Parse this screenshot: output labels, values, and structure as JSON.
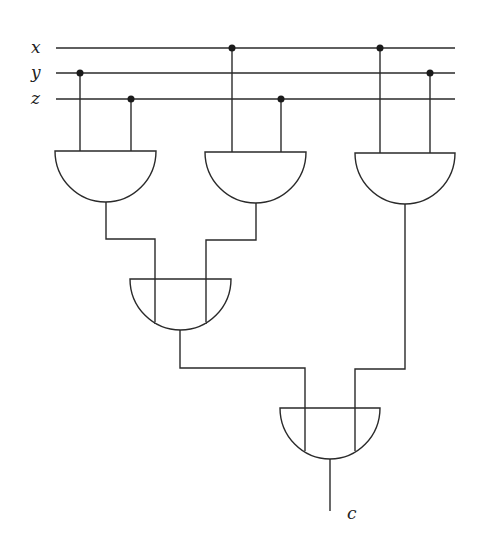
{
  "diagram": {
    "type": "logic-circuit",
    "inputs": [
      {
        "label": "x",
        "line_y": 48
      },
      {
        "label": "y",
        "line_y": 73
      },
      {
        "label": "z",
        "line_y": 99
      }
    ],
    "output": {
      "label": "c"
    },
    "gates": [
      {
        "id": "gate-1",
        "type": "AND",
        "inputs": [
          "y",
          "z"
        ]
      },
      {
        "id": "gate-2",
        "type": "AND",
        "inputs": [
          "x",
          "z"
        ]
      },
      {
        "id": "gate-3",
        "type": "AND",
        "inputs": [
          "x",
          "y"
        ]
      },
      {
        "id": "gate-4",
        "type": "AND",
        "inputs": [
          "gate-1",
          "gate-2"
        ]
      },
      {
        "id": "gate-5",
        "type": "AND",
        "inputs": [
          "gate-4",
          "gate-3"
        ],
        "output": "c"
      }
    ]
  }
}
